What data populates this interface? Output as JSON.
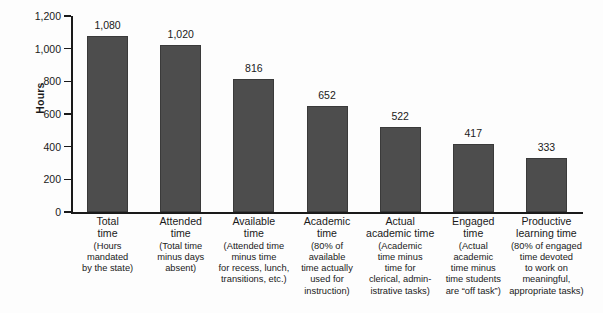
{
  "chart_data": {
    "type": "bar",
    "title": "",
    "subtitle": "",
    "xlabel": "",
    "ylabel": "Hours",
    "ylim": [
      0,
      1200
    ],
    "y_ticks": [
      0,
      200,
      400,
      600,
      800,
      1000,
      1200
    ],
    "y_tick_labels": [
      "0",
      "200",
      "400",
      "600",
      "800",
      "1,000",
      "1,200"
    ],
    "grid": false,
    "legend": false,
    "bar_color": "#4d4d4d",
    "axis_color": "#1a1a1a",
    "background_color": "#fdfdfd",
    "categories": [
      "Total time",
      "Attended time",
      "Available time",
      "Academic time",
      "Actual academic time",
      "Engaged time",
      "Productive learning time"
    ],
    "values": [
      1080,
      1020,
      816,
      652,
      522,
      417,
      333
    ],
    "value_labels": [
      "1,080",
      "1,020",
      "816",
      "652",
      "522",
      "417",
      "333"
    ],
    "bars": [
      {
        "title_lines": [
          "Total",
          "time"
        ],
        "sub_lines": [
          "(Hours",
          "mandated",
          "by the state)"
        ],
        "value": 1080,
        "value_label": "1,080"
      },
      {
        "title_lines": [
          "Attended",
          "time"
        ],
        "sub_lines": [
          "(Total time",
          "minus days",
          "absent)"
        ],
        "value": 1020,
        "value_label": "1,020"
      },
      {
        "title_lines": [
          "Available",
          "time"
        ],
        "sub_lines": [
          "(Attended time",
          "minus time",
          "for recess, lunch,",
          "transitions, etc.)"
        ],
        "value": 816,
        "value_label": "816"
      },
      {
        "title_lines": [
          "Academic",
          "time"
        ],
        "sub_lines": [
          "(80% of",
          "available",
          "time actually",
          "used for",
          "instruction)"
        ],
        "value": 652,
        "value_label": "652"
      },
      {
        "title_lines": [
          "Actual",
          "academic time"
        ],
        "sub_lines": [
          "(Academic",
          "time minus",
          "time for",
          "clerical, admin-",
          "istrative tasks)"
        ],
        "value": 522,
        "value_label": "522"
      },
      {
        "title_lines": [
          "Engaged",
          "time"
        ],
        "sub_lines": [
          "(Actual",
          "academic",
          "time minus",
          "time students",
          "are “off task”)"
        ],
        "value": 417,
        "value_label": "417"
      },
      {
        "title_lines": [
          "Productive",
          "learning time"
        ],
        "sub_lines": [
          "(80% of engaged",
          "time devoted",
          "to work on",
          "meaningful,",
          "appropriate tasks)"
        ],
        "value": 333,
        "value_label": "333"
      }
    ]
  }
}
